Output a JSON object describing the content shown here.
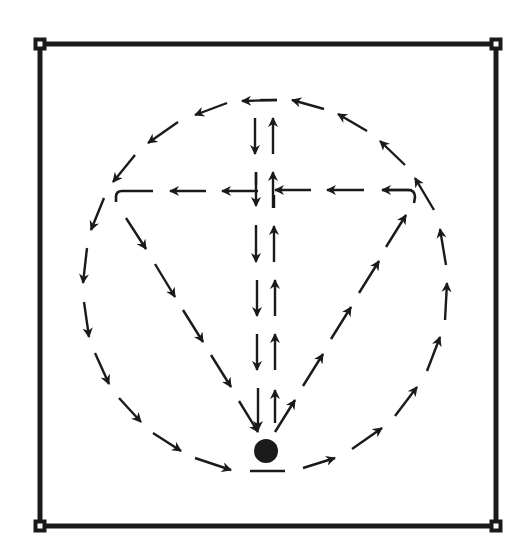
{
  "diagram": {
    "colors": {
      "ink": "#1a1a1a",
      "background": "#ffffff"
    },
    "frame": {
      "x1": 40,
      "y1": 44,
      "x2": 496,
      "y2": 526,
      "stroke": 5,
      "corner_marker_size": 9
    },
    "center_dot": {
      "cx": 266,
      "cy": 451,
      "r": 12
    },
    "base_line": {
      "x1": 250,
      "y1": 471,
      "x2": 285,
      "y2": 471
    },
    "arrows": [
      {
        "group": "circle-left-top",
        "x1": 277,
        "y1": 100,
        "x2": 242,
        "y2": 101
      },
      {
        "group": "circle-left-top",
        "x1": 227,
        "y1": 103,
        "x2": 195,
        "y2": 115
      },
      {
        "group": "circle-left-top",
        "x1": 178,
        "y1": 122,
        "x2": 148,
        "y2": 143
      },
      {
        "group": "circle-left-top",
        "x1": 135,
        "y1": 155,
        "x2": 113,
        "y2": 182
      },
      {
        "group": "circle-left",
        "x1": 104,
        "y1": 198,
        "x2": 91,
        "y2": 230
      },
      {
        "group": "circle-left",
        "x1": 87,
        "y1": 248,
        "x2": 83,
        "y2": 283
      },
      {
        "group": "circle-left",
        "x1": 84,
        "y1": 302,
        "x2": 89,
        "y2": 337
      },
      {
        "group": "circle-left",
        "x1": 95,
        "y1": 353,
        "x2": 109,
        "y2": 384
      },
      {
        "group": "circle-left",
        "x1": 119,
        "y1": 398,
        "x2": 141,
        "y2": 422
      },
      {
        "group": "circle-left",
        "x1": 153,
        "y1": 433,
        "x2": 181,
        "y2": 451
      },
      {
        "group": "circle-left",
        "x1": 195,
        "y1": 458,
        "x2": 231,
        "y2": 470
      },
      {
        "group": "circle-right",
        "x1": 303,
        "y1": 468,
        "x2": 335,
        "y2": 458
      },
      {
        "group": "circle-right",
        "x1": 352,
        "y1": 449,
        "x2": 382,
        "y2": 428
      },
      {
        "group": "circle-right",
        "x1": 395,
        "y1": 416,
        "x2": 417,
        "y2": 387
      },
      {
        "group": "circle-right",
        "x1": 427,
        "y1": 371,
        "x2": 440,
        "y2": 337
      },
      {
        "group": "circle-right",
        "x1": 445,
        "y1": 320,
        "x2": 447,
        "y2": 283
      },
      {
        "group": "circle-right",
        "x1": 446,
        "y1": 265,
        "x2": 440,
        "y2": 229
      },
      {
        "group": "circle-right",
        "x1": 434,
        "y1": 210,
        "x2": 415,
        "y2": 178
      },
      {
        "group": "circle-right-top",
        "x1": 405,
        "y1": 165,
        "x2": 380,
        "y2": 141
      },
      {
        "group": "circle-right-top",
        "x1": 367,
        "y1": 131,
        "x2": 338,
        "y2": 114
      },
      {
        "group": "circle-right-top",
        "x1": 324,
        "y1": 109,
        "x2": 292,
        "y2": 100
      },
      {
        "group": "cross-bar",
        "x1": 412,
        "y1": 190,
        "x2": 382,
        "y2": 190
      },
      {
        "group": "cross-bar",
        "x1": 364,
        "y1": 190,
        "x2": 327,
        "y2": 190
      },
      {
        "group": "cross-bar",
        "x1": 311,
        "y1": 190,
        "x2": 275,
        "y2": 190
      },
      {
        "group": "cross-bar",
        "x1": 258,
        "y1": 191,
        "x2": 222,
        "y2": 191
      },
      {
        "group": "cross-bar",
        "x1": 206,
        "y1": 191,
        "x2": 170,
        "y2": 191
      },
      {
        "group": "down-stem",
        "x1": 255,
        "y1": 118,
        "x2": 255,
        "y2": 154
      },
      {
        "group": "down-stem",
        "x1": 256,
        "y1": 172,
        "x2": 256,
        "y2": 206
      },
      {
        "group": "down-stem",
        "x1": 256,
        "y1": 225,
        "x2": 256,
        "y2": 262
      },
      {
        "group": "down-stem",
        "x1": 257,
        "y1": 280,
        "x2": 257,
        "y2": 316
      },
      {
        "group": "down-stem",
        "x1": 257,
        "y1": 334,
        "x2": 257,
        "y2": 370
      },
      {
        "group": "down-stem",
        "x1": 258,
        "y1": 388,
        "x2": 258,
        "y2": 430
      },
      {
        "group": "up-stem",
        "x1": 275,
        "y1": 423,
        "x2": 275,
        "y2": 390
      },
      {
        "group": "up-stem",
        "x1": 275,
        "y1": 370,
        "x2": 275,
        "y2": 334
      },
      {
        "group": "up-stem",
        "x1": 275,
        "y1": 316,
        "x2": 275,
        "y2": 280
      },
      {
        "group": "up-stem",
        "x1": 274,
        "y1": 262,
        "x2": 274,
        "y2": 226
      },
      {
        "group": "up-stem",
        "x1": 273,
        "y1": 208,
        "x2": 273,
        "y2": 172
      },
      {
        "group": "up-stem",
        "x1": 273,
        "y1": 154,
        "x2": 273,
        "y2": 118
      },
      {
        "group": "left-diagonal",
        "x1": 126,
        "y1": 218,
        "x2": 146,
        "y2": 249
      },
      {
        "group": "left-diagonal",
        "x1": 155,
        "y1": 264,
        "x2": 175,
        "y2": 297
      },
      {
        "group": "left-diagonal",
        "x1": 183,
        "y1": 310,
        "x2": 203,
        "y2": 342
      },
      {
        "group": "left-diagonal",
        "x1": 211,
        "y1": 355,
        "x2": 231,
        "y2": 387
      },
      {
        "group": "left-diagonal",
        "x1": 239,
        "y1": 401,
        "x2": 258,
        "y2": 432
      },
      {
        "group": "right-diagonal",
        "x1": 275,
        "y1": 432,
        "x2": 295,
        "y2": 400
      },
      {
        "group": "right-diagonal",
        "x1": 303,
        "y1": 386,
        "x2": 323,
        "y2": 354
      },
      {
        "group": "right-diagonal",
        "x1": 331,
        "y1": 339,
        "x2": 351,
        "y2": 307
      },
      {
        "group": "right-diagonal",
        "x1": 359,
        "y1": 293,
        "x2": 379,
        "y2": 261
      },
      {
        "group": "right-diagonal",
        "x1": 386,
        "y1": 247,
        "x2": 406,
        "y2": 215
      }
    ],
    "plain_segments": [
      {
        "group": "circle-top",
        "x1": 260,
        "y1": 100,
        "x2": 277,
        "y2": 100
      },
      {
        "group": "down-stem-end",
        "x1": 256,
        "y1": 172,
        "x2": 256,
        "y2": 185
      },
      {
        "group": "up-stem-end",
        "x1": 274,
        "y1": 195,
        "x2": 274,
        "y2": 208
      }
    ],
    "hooks": [
      {
        "name": "left-hook",
        "d": "M 153 191 L 122 191 Q 116 191 116 197 L 116 202"
      },
      {
        "name": "right-hook",
        "d": "M 382 190 L 408 190 Q 415 190 415 197 L 414 203"
      }
    ]
  }
}
